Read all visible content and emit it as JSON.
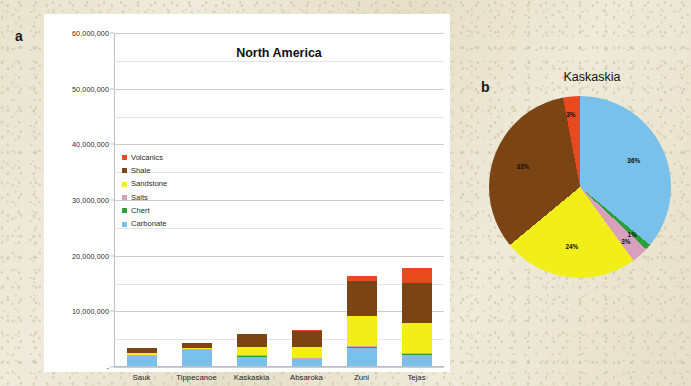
{
  "panel_a": {
    "label": "a",
    "title": "North America",
    "y_ticks": [
      "60,000,000",
      "50,000,000",
      "40,000,000",
      "30,000,000",
      "20,000,000",
      "10,000,000",
      "-"
    ],
    "legend": [
      {
        "label": "Volcanics",
        "color": "#e8491d"
      },
      {
        "label": "Shale",
        "color": "#7a4414"
      },
      {
        "label": "Sandstone",
        "color": "#f2ee1a"
      },
      {
        "label": "Salts",
        "color": "#d9a0bd"
      },
      {
        "label": "Chert",
        "color": "#2aa03a"
      },
      {
        "label": "Carbonate",
        "color": "#79c0ea"
      }
    ]
  },
  "panel_b": {
    "label": "b",
    "title": "Kaskaskia"
  },
  "chart_data": [
    {
      "type": "bar",
      "id": "north-america-stacked-bar",
      "title": "North America",
      "stacked": true,
      "xlabel": "",
      "ylabel": "",
      "ylim": [
        0,
        60000000
      ],
      "ytick_values": [
        0,
        10000000,
        20000000,
        30000000,
        40000000,
        50000000,
        60000000
      ],
      "ytick_labels": [
        "-",
        "10,000,000",
        "20,000,000",
        "30,000,000",
        "40,000,000",
        "50,000,000",
        "60,000,000"
      ],
      "grid": true,
      "legend_position": "inside-upper-left",
      "categories": [
        "Sauk",
        "Tippecanoe",
        "Kaskaskia",
        "Absaroka",
        "Zuni",
        "Tejas"
      ],
      "series": [
        {
          "name": "Carbonate",
          "color": "#79c0ea",
          "values": [
            1800000,
            2900000,
            1700000,
            1200000,
            3300000,
            2000000
          ]
        },
        {
          "name": "Chert",
          "color": "#2aa03a",
          "values": [
            60000,
            60000,
            60000,
            60000,
            100000,
            100000
          ]
        },
        {
          "name": "Salts",
          "color": "#d9a0bd",
          "values": [
            60000,
            60000,
            150000,
            250000,
            200000,
            200000
          ]
        },
        {
          "name": "Sandstone",
          "color": "#f2ee1a",
          "values": [
            500000,
            200000,
            1500000,
            1900000,
            5300000,
            5400000
          ]
        },
        {
          "name": "Shale",
          "color": "#7a4414",
          "values": [
            800000,
            900000,
            2300000,
            2900000,
            6400000,
            7300000
          ]
        },
        {
          "name": "Volcanics",
          "color": "#e8491d",
          "values": [
            50000,
            50000,
            100000,
            150000,
            900000,
            2700000
          ]
        }
      ],
      "totals": [
        3270000,
        4170000,
        5810000,
        6460000,
        16200000,
        17700000
      ]
    },
    {
      "type": "pie",
      "id": "kaskaskia-pie",
      "title": "Kaskaskia",
      "start_angle_deg": 0,
      "direction": "clockwise",
      "slices": [
        {
          "label": "Carbonate",
          "percent": 36,
          "display": "36%",
          "color": "#79c0ea"
        },
        {
          "label": "Chert",
          "percent": 1,
          "display": "1%",
          "color": "#2aa03a"
        },
        {
          "label": "Salts",
          "percent": 3,
          "display": "3%",
          "color": "#d9a0bd"
        },
        {
          "label": "Sandstone",
          "percent": 24,
          "display": "24%",
          "color": "#f2ee1a"
        },
        {
          "label": "Shale",
          "percent": 33,
          "display": "33%",
          "color": "#7a4414"
        },
        {
          "label": "Volcanics",
          "percent": 3,
          "display": "3%",
          "color": "#e8491d"
        }
      ]
    }
  ]
}
